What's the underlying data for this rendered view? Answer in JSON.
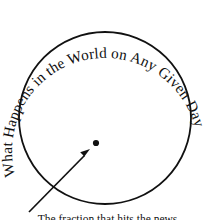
{
  "figure": {
    "title": "What Happens in the World on Any Given Day",
    "background_color": "#ffffff",
    "ink_color": "#111111",
    "width": 215,
    "height": 220
  },
  "circle": {
    "name": "world-boundary-circle",
    "center_x": 105,
    "center_y": 118,
    "radius": 86,
    "stroke_color": "#111111",
    "stroke_width": 1.8,
    "fill": "none"
  },
  "arc_text": {
    "content": "What Happens in the World on Any Given Day",
    "font_size": 15.2,
    "color": "#111111",
    "path_radius": 93,
    "start_offset_percent": 2
  },
  "marker": {
    "name": "single-day-dot",
    "x": 96,
    "y": 143,
    "radius": 3.1,
    "color": "#111111"
  },
  "pointer": {
    "name": "annotation-arrow",
    "tail_x": 29,
    "tail_y": 212,
    "tip_x": 90,
    "tip_y": 150,
    "stroke_color": "#111111",
    "stroke_width": 1.7
  },
  "caption": {
    "line1": "The fraction that hits the news",
    "visible": "clipped"
  }
}
